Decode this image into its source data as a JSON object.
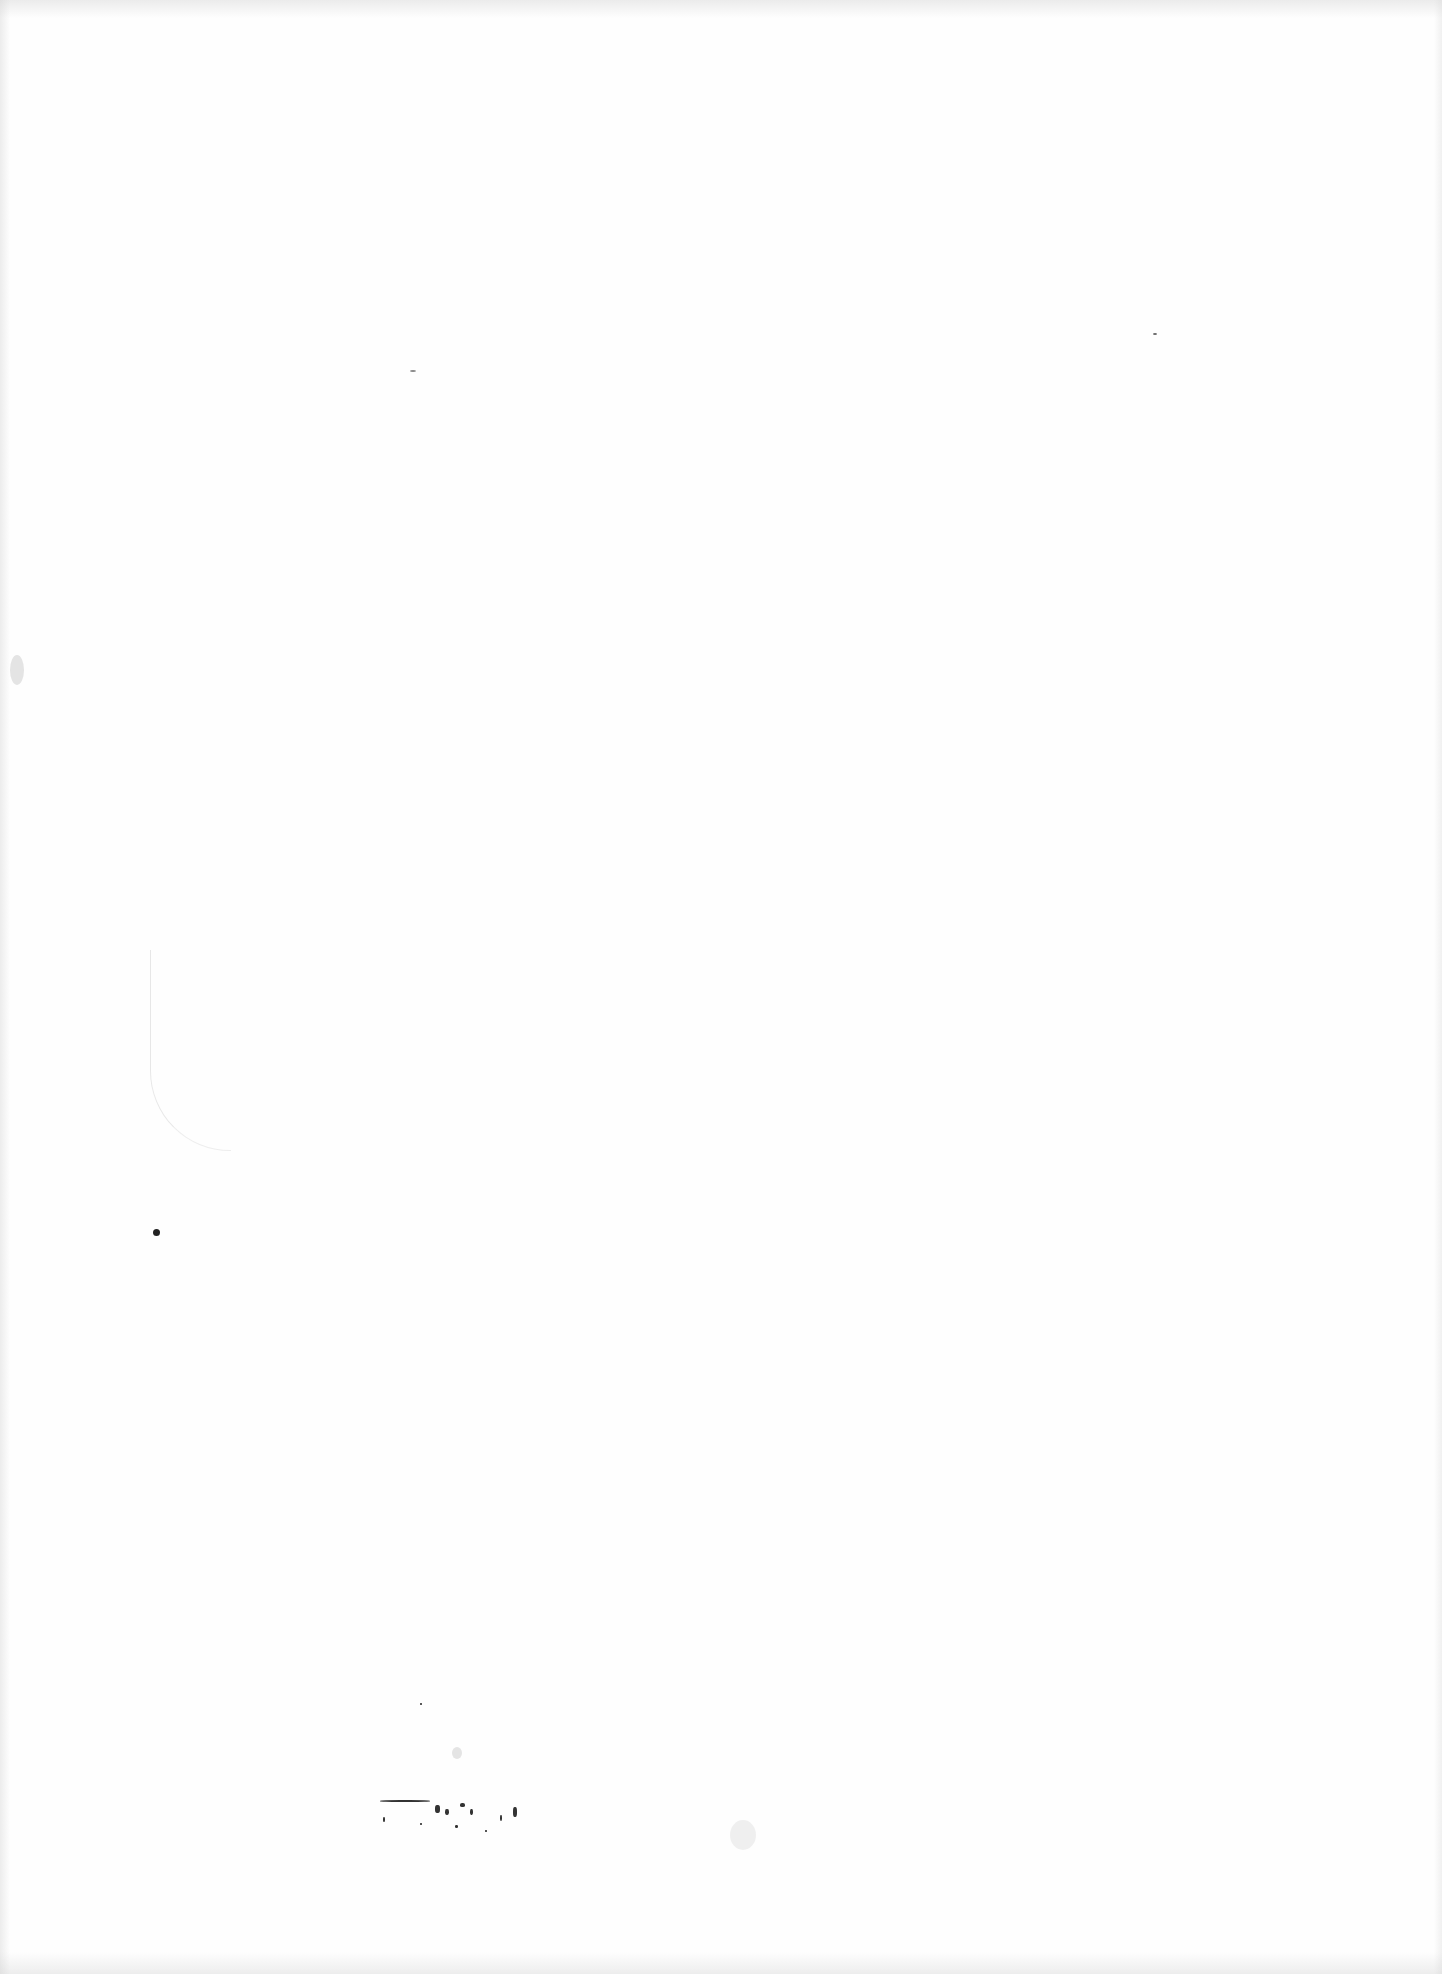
{
  "page": {
    "type": "blank scanned page",
    "background_color": "#fefefe",
    "artifact_color": "#222222"
  }
}
